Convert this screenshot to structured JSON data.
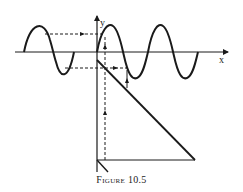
{
  "figure": {
    "caption_word": "Figure",
    "caption_number": "10.5",
    "axis_x_label": "x",
    "axis_y_label": "y"
  },
  "colors": {
    "stroke": "#1a1a1a",
    "background": "#ffffff"
  }
}
